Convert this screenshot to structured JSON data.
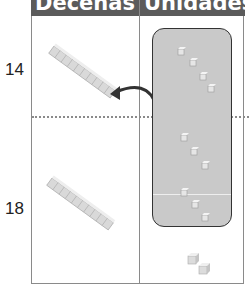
{
  "header": {
    "columns": [
      {
        "label": "Decenas"
      },
      {
        "label": "Unidades"
      }
    ],
    "background": "#5b5b5b",
    "text_color": "#ffffff"
  },
  "rows": [
    {
      "label": "14",
      "tens_rods": 1,
      "ones_cubes": 4
    },
    {
      "label": "18",
      "tens_rods": 1,
      "ones_cubes": 8
    }
  ],
  "regrouping": {
    "grouped_cubes": 10,
    "loose_cubes": 2,
    "arrow_direction": "left",
    "box_color": "#c9c9c9"
  }
}
